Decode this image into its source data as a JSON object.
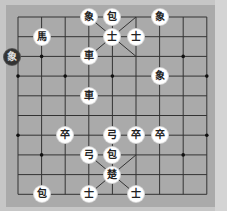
{
  "board": {
    "cols": 9,
    "rows": 10,
    "origin_x": 18,
    "origin_y": 17,
    "step_x": 23.6,
    "step_y": 19.7,
    "colors": {
      "outer": "#c6c6c6",
      "board": "#aaaaaa",
      "line": "#333333",
      "right_strip": "#d4d4d4"
    },
    "markers": [
      {
        "col": 1,
        "row": 7
      },
      {
        "col": 7,
        "row": 2
      },
      {
        "col": 0,
        "row": 3
      },
      {
        "col": 2,
        "row": 3
      },
      {
        "col": 4,
        "row": 3
      },
      {
        "col": 8,
        "row": 3
      },
      {
        "col": 0,
        "row": 6
      },
      {
        "col": 8,
        "row": 6
      },
      {
        "col": 1,
        "row": 2
      },
      {
        "col": 7,
        "row": 7
      }
    ]
  },
  "pieces": [
    {
      "label": "象",
      "col": 3,
      "row": 0,
      "name": "elephant"
    },
    {
      "label": "包",
      "col": 4,
      "row": 0,
      "name": "cannon"
    },
    {
      "label": "象",
      "col": 6,
      "row": 0,
      "name": "elephant"
    },
    {
      "label": "馬",
      "col": 1,
      "row": 1,
      "name": "horse"
    },
    {
      "label": "士",
      "col": 4,
      "row": 1,
      "name": "advisor"
    },
    {
      "label": "士",
      "col": 5,
      "row": 1,
      "name": "advisor"
    },
    {
      "label": "車",
      "col": 3,
      "row": 2,
      "name": "chariot"
    },
    {
      "label": "象",
      "col": 6,
      "row": 3,
      "name": "elephant"
    },
    {
      "label": "車",
      "col": 3,
      "row": 4,
      "name": "chariot"
    },
    {
      "label": "卒",
      "col": 2,
      "row": 6,
      "name": "soldier"
    },
    {
      "label": "弓",
      "col": 4,
      "row": 6,
      "name": "bow"
    },
    {
      "label": "卒",
      "col": 5,
      "row": 6,
      "name": "soldier"
    },
    {
      "label": "卒",
      "col": 6,
      "row": 6,
      "name": "soldier"
    },
    {
      "label": "弓",
      "col": 3,
      "row": 7,
      "name": "bow"
    },
    {
      "label": "包",
      "col": 4,
      "row": 7,
      "name": "cannon"
    },
    {
      "label": "楚",
      "col": 4,
      "row": 8,
      "name": "general"
    },
    {
      "label": "包",
      "col": 1,
      "row": 9,
      "name": "cannon"
    },
    {
      "label": "士",
      "col": 3,
      "row": 9,
      "name": "advisor"
    },
    {
      "label": "士",
      "col": 5,
      "row": 9,
      "name": "advisor"
    }
  ],
  "selected_piece": {
    "label": "象",
    "x": 12,
    "y": 57,
    "name": "elephant"
  }
}
